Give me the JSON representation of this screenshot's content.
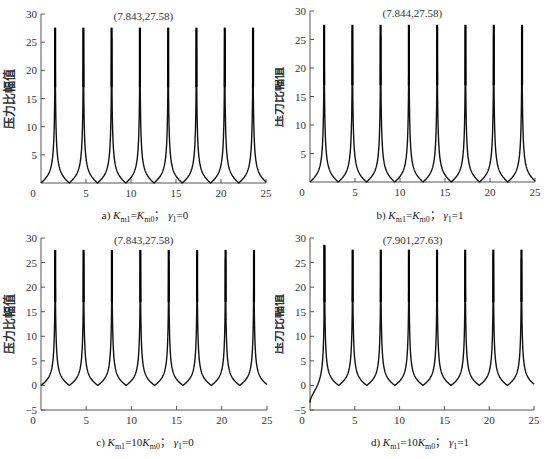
{
  "figure": {
    "ylabel": "压力比幅值",
    "xlabel": "ω_Z",
    "xlabel_main": "ω",
    "xlabel_sub": "Z"
  },
  "chart_data": [
    {
      "id": "a",
      "type": "line",
      "title": "",
      "caption": "a) Km1=Km0; γ1=0",
      "caption_parts": {
        "prefix": "a) ",
        "k1": "K",
        "k1sub": "m1",
        "eq": "=",
        "coef": "",
        "k0": "K",
        "k0sub": "m0",
        "sep": "；",
        "g": "γ",
        "gsub": "1",
        "gval": "=0"
      },
      "annotation": "(7.843,27.58)",
      "peak": {
        "x": 7.843,
        "y": 27.58
      },
      "xlabel": "ωZ",
      "ylabel": "压力比幅值",
      "xlim": [
        0,
        25
      ],
      "ylim": [
        0,
        30
      ],
      "xticks": [
        0,
        5,
        10,
        15,
        20,
        25
      ],
      "yticks": [
        5,
        10,
        15,
        20,
        25,
        30
      ],
      "peaks_x": [
        1.57,
        4.71,
        7.843,
        10.99,
        14.13,
        17.27,
        20.42,
        23.56
      ],
      "peak_value": 27.58,
      "minima_x": [
        3.14,
        6.28,
        9.42,
        12.57,
        15.71,
        18.85,
        21.99
      ],
      "minimum_value": 0,
      "start_value": 0,
      "grid": false
    },
    {
      "id": "b",
      "type": "line",
      "caption": "b) Km1=Km0; γ1=1",
      "caption_parts": {
        "prefix": "b) ",
        "k1": "K",
        "k1sub": "m1",
        "eq": "=",
        "coef": "",
        "k0": "K",
        "k0sub": "m0",
        "sep": "；",
        "g": "γ",
        "gsub": "1",
        "gval": "=1"
      },
      "annotation": "(7.844,27.58)",
      "peak": {
        "x": 7.844,
        "y": 27.58
      },
      "xlabel": "ωZ",
      "ylabel": "压力比幅值",
      "xlim": [
        0,
        25
      ],
      "ylim": [
        0,
        30
      ],
      "xticks": [
        0,
        5,
        10,
        15,
        20,
        25
      ],
      "yticks": [
        5,
        10,
        15,
        20,
        25,
        30
      ],
      "peaks_x": [
        1.57,
        4.71,
        7.844,
        10.99,
        14.13,
        17.27,
        20.42,
        23.56
      ],
      "peak_value": 27.58,
      "minima_x": [
        3.14,
        6.28,
        9.42,
        12.57,
        15.71,
        18.85,
        21.99
      ],
      "minimum_value": 0,
      "start_value": 0,
      "grid": false
    },
    {
      "id": "c",
      "type": "line",
      "caption": "c) Km1=10Km0; γ1=0",
      "caption_parts": {
        "prefix": "c) ",
        "k1": "K",
        "k1sub": "m1",
        "eq": "=",
        "coef": "10",
        "k0": "K",
        "k0sub": "m0",
        "sep": "；",
        "g": "γ",
        "gsub": "1",
        "gval": "=0"
      },
      "annotation": "(7.843,27.58)",
      "peak": {
        "x": 7.843,
        "y": 27.58
      },
      "xlabel": "ωZ",
      "ylabel": "压力比幅值",
      "xlim": [
        0,
        25
      ],
      "ylim": [
        -5,
        30
      ],
      "xticks": [
        0,
        5,
        10,
        15,
        20,
        25
      ],
      "yticks": [
        -5,
        0,
        5,
        10,
        15,
        20,
        25,
        30
      ],
      "peaks_x": [
        1.57,
        4.71,
        7.843,
        10.99,
        14.13,
        17.27,
        20.42,
        23.56
      ],
      "peak_value": 27.58,
      "minima_x": [
        3.14,
        6.28,
        9.42,
        12.57,
        15.71,
        18.85,
        21.99
      ],
      "minimum_value": 0,
      "start_value": 0,
      "grid": false
    },
    {
      "id": "d",
      "type": "line",
      "caption": "d) Km1=10Km0; γ1=1",
      "caption_parts": {
        "prefix": "d) ",
        "k1": "K",
        "k1sub": "m1",
        "eq": "=",
        "coef": "10",
        "k0": "K",
        "k0sub": "m0",
        "sep": "；",
        "g": "γ",
        "gsub": "1",
        "gval": "=1"
      },
      "annotation": "(7.901,27.63)",
      "peak": {
        "x": 7.901,
        "y": 27.63
      },
      "xlabel": "ωZ",
      "ylabel": "压力比幅值",
      "xlim": [
        0,
        25
      ],
      "ylim": [
        -5,
        30
      ],
      "xticks": [
        0,
        5,
        10,
        15,
        20,
        25
      ],
      "yticks": [
        -5,
        0,
        5,
        10,
        15,
        20,
        25,
        30
      ],
      "peaks_x": [
        1.62,
        4.76,
        7.901,
        11.04,
        14.18,
        17.32,
        20.46,
        23.6
      ],
      "peak_value": 27.63,
      "first_peak_value": 28.5,
      "minima_x": [
        3.2,
        6.34,
        9.48,
        12.62,
        15.76,
        18.9,
        22.04
      ],
      "minimum_value": 0,
      "start_value": -3.5,
      "grid": false
    }
  ]
}
